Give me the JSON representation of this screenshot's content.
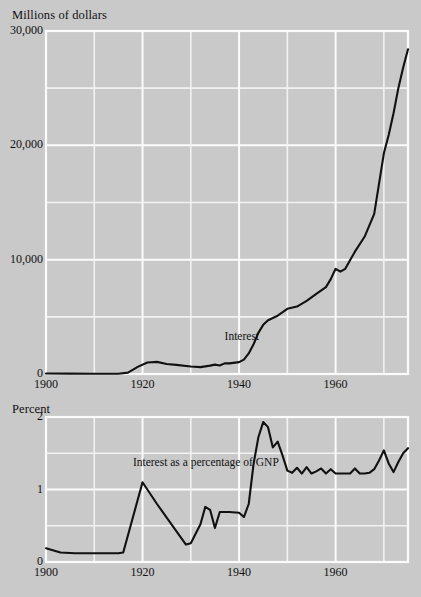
{
  "figure": {
    "background_color": "#c9c9c9",
    "grid_color": "#f7f7f7",
    "line_color": "#111111"
  },
  "chart_data": [
    {
      "type": "line",
      "id": "interest-dollars",
      "title": "Millions of dollars",
      "xlabel": "",
      "ylabel": "Millions of dollars",
      "xlim": [
        1900,
        1975
      ],
      "ylim": [
        0,
        30000
      ],
      "xticks": [
        1900,
        1920,
        1940,
        1960
      ],
      "xticklabels": [
        "1900",
        "1920",
        "1940",
        "1960"
      ],
      "yticks": [
        0,
        10000,
        20000,
        30000
      ],
      "yticklabels": [
        "0",
        "10,000",
        "20,000",
        "30,000"
      ],
      "y_gridlines": [
        0,
        5000,
        10000,
        15000,
        20000,
        25000,
        30000
      ],
      "x_gridlines": [
        1900,
        1910,
        1920,
        1930,
        1940,
        1950,
        1960,
        1970
      ],
      "grid": true,
      "legend": "none",
      "annotations": [
        {
          "text": "Interest",
          "x": 1937,
          "y": 3200
        }
      ],
      "series": [
        {
          "name": "Interest",
          "x": [
            1900,
            1905,
            1910,
            1915,
            1917,
            1919,
            1921,
            1923,
            1925,
            1927,
            1930,
            1932,
            1934,
            1935,
            1936,
            1937,
            1938,
            1940,
            1941,
            1942,
            1943,
            1944,
            1945,
            1946,
            1947,
            1948,
            1950,
            1952,
            1954,
            1956,
            1958,
            1959,
            1960,
            1961,
            1962,
            1964,
            1966,
            1968,
            1970,
            1971,
            1972,
            1973,
            1974,
            1975
          ],
          "y": [
            40,
            30,
            20,
            20,
            120,
            620,
            1000,
            1060,
            880,
            800,
            660,
            600,
            730,
            820,
            750,
            930,
            930,
            1040,
            1260,
            1800,
            2600,
            3600,
            4300,
            4700,
            4900,
            5100,
            5700,
            5900,
            6400,
            7000,
            7600,
            8300,
            9200,
            8950,
            9200,
            10700,
            12000,
            14000,
            19300,
            20900,
            22800,
            25000,
            26800,
            28400
          ]
        }
      ]
    },
    {
      "type": "line",
      "id": "interest-percent-gnp",
      "title": "Percent",
      "xlabel": "",
      "ylabel": "Percent",
      "xlim": [
        1900,
        1975
      ],
      "ylim": [
        0,
        2
      ],
      "xticks": [
        1900,
        1920,
        1940,
        1960
      ],
      "xticklabels": [
        "1900",
        "1920",
        "1940",
        "1960"
      ],
      "yticks": [
        0,
        1,
        2
      ],
      "yticklabels": [
        "0",
        "1",
        "2"
      ],
      "y_gridlines": [
        0,
        0.5,
        1,
        1.5,
        2
      ],
      "x_gridlines": [
        1900,
        1910,
        1920,
        1930,
        1940,
        1950,
        1960,
        1970
      ],
      "grid": true,
      "legend": "none",
      "annotations": [
        {
          "text": "Interest as a percentage of GNP",
          "x": 1918,
          "y": 1.36
        }
      ],
      "series": [
        {
          "name": "Interest as a percentage of GNP",
          "x": [
            1900,
            1903,
            1906,
            1910,
            1915,
            1916,
            1920,
            1923,
            1926,
            1929,
            1930,
            1932,
            1933,
            1934,
            1935,
            1936,
            1937,
            1938,
            1940,
            1941,
            1942,
            1943,
            1944,
            1945,
            1946,
            1947,
            1948,
            1949,
            1950,
            1951,
            1952,
            1953,
            1954,
            1955,
            1956,
            1957,
            1958,
            1959,
            1960,
            1961,
            1962,
            1963,
            1964,
            1965,
            1966,
            1967,
            1968,
            1969,
            1970,
            1971,
            1972,
            1973,
            1974,
            1975
          ],
          "y": [
            0.19,
            0.13,
            0.12,
            0.12,
            0.12,
            0.13,
            1.1,
            0.8,
            0.52,
            0.24,
            0.26,
            0.52,
            0.76,
            0.72,
            0.47,
            0.69,
            0.69,
            0.69,
            0.68,
            0.62,
            0.8,
            1.35,
            1.72,
            1.93,
            1.86,
            1.58,
            1.66,
            1.47,
            1.26,
            1.23,
            1.3,
            1.22,
            1.31,
            1.22,
            1.25,
            1.29,
            1.22,
            1.28,
            1.22,
            1.22,
            1.22,
            1.22,
            1.29,
            1.22,
            1.22,
            1.23,
            1.28,
            1.4,
            1.54,
            1.36,
            1.24,
            1.38,
            1.5,
            1.57
          ]
        }
      ]
    }
  ]
}
